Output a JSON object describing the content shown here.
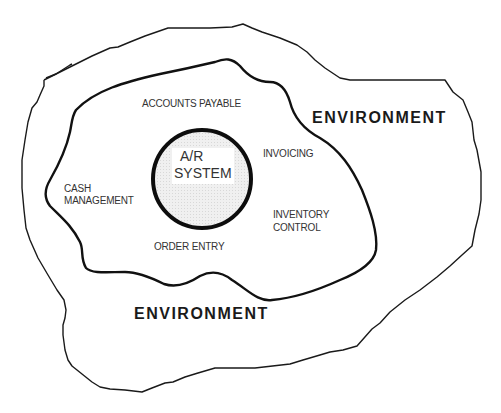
{
  "diagram": {
    "type": "nested-context-diagram",
    "colors": {
      "line": "#111111",
      "core_fill": "#ececec",
      "background": "#ffffff",
      "text": "#333333"
    },
    "core": {
      "line1": "A/R",
      "line2": "SYSTEM"
    },
    "subsystems": [
      {
        "name": "accounts-payable",
        "label": "ACCOUNTS PAYABLE"
      },
      {
        "name": "invoicing",
        "label": "INVOICING"
      },
      {
        "name": "cash-management",
        "line1": "CASH",
        "line2": "MANAGEMENT"
      },
      {
        "name": "inventory-control",
        "line1": "INVENTORY",
        "line2": "CONTROL"
      },
      {
        "name": "order-entry",
        "label": "ORDER ENTRY"
      }
    ],
    "environment_labels": [
      "ENVIRONMENT",
      "ENVIRONMENT"
    ]
  }
}
